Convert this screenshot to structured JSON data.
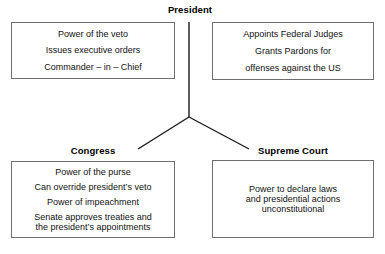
{
  "diagram": {
    "title_visible": false,
    "background_color": "#ffffff",
    "line_color": "#1a1a1a",
    "border_color": "#6f6f6f",
    "text_color": "#111111"
  },
  "nodes": {
    "president": {
      "label": "President",
      "left_box": {
        "lines": [
          "Power of the veto",
          "Issues executive orders",
          "Commander – in – Chief"
        ]
      },
      "right_box": {
        "lines": [
          "Appoints Federal Judges"
        ],
        "grouped_lines": [
          "Grants Pardons for",
          "offenses against the US"
        ]
      }
    },
    "congress": {
      "label": "Congress",
      "box": {
        "lines": [
          "Power of the purse",
          "Can override president’s veto",
          "Power of impeachment"
        ],
        "grouped_lines": [
          "Senate approves treaties and",
          "the president’s appointments"
        ]
      }
    },
    "supreme_court": {
      "label": "Supreme Court",
      "box": {
        "lines": [
          "Power to declare laws",
          "and presidential actions",
          "unconstitutional"
        ]
      }
    }
  },
  "connectors": [
    {
      "name": "president-stem",
      "from": [
        189,
        22
      ],
      "to": [
        189,
        117
      ]
    },
    {
      "name": "branch-to-congress",
      "from": [
        189,
        117
      ],
      "to": [
        138,
        149
      ]
    },
    {
      "name": "branch-to-supreme-court",
      "from": [
        189,
        117
      ],
      "to": [
        249,
        149
      ]
    }
  ]
}
